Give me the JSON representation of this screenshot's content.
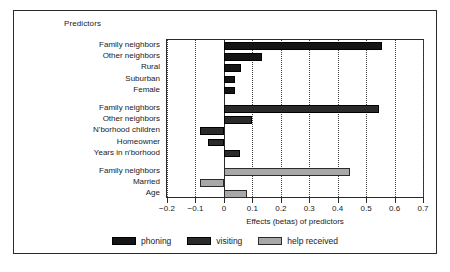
{
  "figure": {
    "predictors_heading": "Predictors"
  },
  "chart_data": {
    "type": "bar",
    "orientation": "horizontal",
    "title": "",
    "xlabel": "Effects (betas) of predictors",
    "ylabel": "Predictors",
    "xlim": [
      -0.2,
      0.7
    ],
    "xticks": [
      -0.2,
      -0.1,
      0,
      0.1,
      0.2,
      0.3,
      0.4,
      0.5,
      0.6,
      0.7
    ],
    "xtick_labels": [
      "−0.2",
      "−0.1",
      "0",
      "0.1",
      "0.2",
      "0.3",
      "0.4",
      "0.5",
      "0.6",
      "0.7"
    ],
    "grid": true,
    "grid_style": "dotted vertical",
    "legend_position": "bottom",
    "groups": [
      {
        "series": "phoning",
        "color": "#151515",
        "categories": [
          "Family neighbors",
          "Other neighbors",
          "Rural",
          "Suburban",
          "Female"
        ],
        "values": [
          0.555,
          0.135,
          0.06,
          0.04,
          0.04
        ]
      },
      {
        "series": "visiting",
        "color": "#2a2a2a",
        "categories": [
          "Family neighbors",
          "Other neighbors",
          "N'borhood children",
          "Homeowner",
          "Years in n'borhood"
        ],
        "values": [
          0.545,
          0.1,
          -0.085,
          -0.055,
          0.055
        ]
      },
      {
        "series": "help received",
        "color": "#a8a8a8",
        "categories": [
          "Family neighbors",
          "Married",
          "Age"
        ],
        "values": [
          0.445,
          -0.085,
          0.08
        ]
      }
    ],
    "legend": [
      {
        "label": "phoning",
        "color": "#151515"
      },
      {
        "label": "visiting",
        "color": "#2a2a2a"
      },
      {
        "label": "help received",
        "color": "#a8a8a8"
      }
    ]
  }
}
